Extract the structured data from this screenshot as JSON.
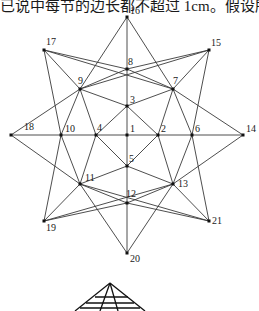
{
  "header_text": "已说中每节的边长都不超过 1cm。假设所有杆件其有相",
  "diagram": {
    "nodes": [
      {
        "id": "1",
        "x": 127,
        "y": 135,
        "lx": 3,
        "ly": -3
      },
      {
        "id": "2",
        "x": 158,
        "y": 135,
        "lx": 3,
        "ly": -3
      },
      {
        "id": "3",
        "x": 127,
        "y": 106,
        "lx": 3,
        "ly": -3
      },
      {
        "id": "4",
        "x": 96,
        "y": 135,
        "lx": 1,
        "ly": -4
      },
      {
        "id": "5",
        "x": 127,
        "y": 166,
        "lx": 2,
        "ly": -4
      },
      {
        "id": "6",
        "x": 192,
        "y": 135,
        "lx": 3,
        "ly": -3
      },
      {
        "id": "7",
        "x": 173,
        "y": 89,
        "lx": 0,
        "ly": -5
      },
      {
        "id": "8",
        "x": 127,
        "y": 69,
        "lx": 1,
        "ly": -4
      },
      {
        "id": "9",
        "x": 80,
        "y": 89,
        "lx": -2,
        "ly": -5
      },
      {
        "id": "10",
        "x": 61,
        "y": 135,
        "lx": 4,
        "ly": -3
      },
      {
        "id": "11",
        "x": 80,
        "y": 184,
        "lx": 5,
        "ly": -3
      },
      {
        "id": "12",
        "x": 127,
        "y": 203,
        "lx": -1,
        "ly": -6
      },
      {
        "id": "13",
        "x": 173,
        "y": 184,
        "lx": 5,
        "ly": 3
      },
      {
        "id": "14",
        "x": 243,
        "y": 135,
        "lx": 3,
        "ly": -3
      },
      {
        "id": "15",
        "x": 209,
        "y": 50,
        "lx": 2,
        "ly": -4
      },
      {
        "id": "16",
        "x": 127,
        "y": 17,
        "lx": 3,
        "ly": -3
      },
      {
        "id": "17",
        "x": 44,
        "y": 50,
        "lx": 2,
        "ly": -5
      },
      {
        "id": "18",
        "x": 11,
        "y": 135,
        "lx": 13,
        "ly": -5
      },
      {
        "id": "19",
        "x": 44,
        "y": 221,
        "lx": 2,
        "ly": 10
      },
      {
        "id": "20",
        "x": 127,
        "y": 253,
        "lx": 3,
        "ly": 9
      },
      {
        "id": "21",
        "x": 209,
        "y": 221,
        "lx": 3,
        "ly": 3
      }
    ],
    "edges": [
      [
        "16",
        "9"
      ],
      [
        "16",
        "7"
      ],
      [
        "16",
        "8"
      ],
      [
        "8",
        "3"
      ],
      [
        "3",
        "1"
      ],
      [
        "1",
        "5"
      ],
      [
        "5",
        "12"
      ],
      [
        "12",
        "20"
      ],
      [
        "17",
        "8"
      ],
      [
        "17",
        "9"
      ],
      [
        "17",
        "10"
      ],
      [
        "17",
        "7"
      ],
      [
        "15",
        "8"
      ],
      [
        "15",
        "7"
      ],
      [
        "15",
        "6"
      ],
      [
        "15",
        "9"
      ],
      [
        "18",
        "9"
      ],
      [
        "18",
        "10"
      ],
      [
        "18",
        "11"
      ],
      [
        "10",
        "4"
      ],
      [
        "4",
        "1"
      ],
      [
        "1",
        "2"
      ],
      [
        "2",
        "6"
      ],
      [
        "6",
        "14"
      ],
      [
        "14",
        "7"
      ],
      [
        "14",
        "13"
      ],
      [
        "19",
        "11"
      ],
      [
        "19",
        "12"
      ],
      [
        "19",
        "10"
      ],
      [
        "19",
        "13"
      ],
      [
        "21",
        "13"
      ],
      [
        "21",
        "12"
      ],
      [
        "21",
        "6"
      ],
      [
        "21",
        "11"
      ],
      [
        "20",
        "11"
      ],
      [
        "20",
        "13"
      ],
      [
        "9",
        "3"
      ],
      [
        "9",
        "10"
      ],
      [
        "9",
        "4"
      ],
      [
        "7",
        "3"
      ],
      [
        "7",
        "2"
      ],
      [
        "7",
        "6"
      ],
      [
        "3",
        "4"
      ],
      [
        "3",
        "2"
      ],
      [
        "5",
        "4"
      ],
      [
        "5",
        "2"
      ],
      [
        "5",
        "11"
      ],
      [
        "5",
        "13"
      ],
      [
        "11",
        "10"
      ],
      [
        "11",
        "4"
      ],
      [
        "11",
        "12"
      ],
      [
        "13",
        "6"
      ],
      [
        "13",
        "2"
      ],
      [
        "13",
        "12"
      ],
      [
        "8",
        "9"
      ],
      [
        "8",
        "7"
      ]
    ]
  },
  "solid_preview": {
    "apex": [
      110,
      283
    ],
    "lines": [
      [
        110,
        283,
        75,
        311
      ],
      [
        110,
        283,
        145,
        311
      ],
      [
        110,
        283,
        100,
        311
      ],
      [
        110,
        283,
        118,
        311
      ],
      [
        86,
        303,
        134,
        303
      ],
      [
        80,
        308,
        140,
        308
      ],
      [
        95,
        297,
        128,
        297
      ]
    ]
  }
}
